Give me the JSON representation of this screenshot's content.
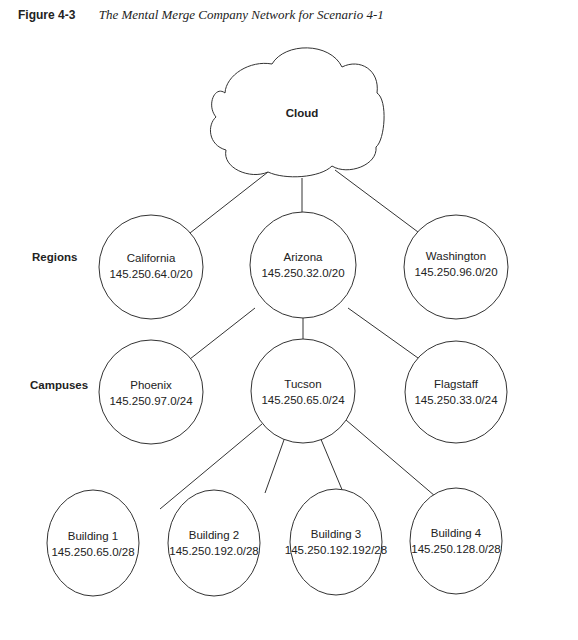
{
  "caption": {
    "figure_label": "Figure 4-3",
    "title": "The Mental Merge Company Network for Scenario 4-1"
  },
  "tiers": {
    "regions": "Regions",
    "campuses": "Campuses"
  },
  "cloud": {
    "label": "Cloud"
  },
  "regions": [
    {
      "name": "California",
      "subnet": "145.250.64.0/20"
    },
    {
      "name": "Arizona",
      "subnet": "145.250.32.0/20"
    },
    {
      "name": "Washington",
      "subnet": "145.250.96.0/20"
    }
  ],
  "campuses": [
    {
      "name": "Phoenix",
      "subnet": "145.250.97.0/24"
    },
    {
      "name": "Tucson",
      "subnet": "145.250.65.0/24"
    },
    {
      "name": "Flagstaff",
      "subnet": "145.250.33.0/24"
    }
  ],
  "buildings": [
    {
      "name": "Building 1",
      "subnet": "145.250.65.0/28"
    },
    {
      "name": "Building 2",
      "subnet": "145.250.192.0/28"
    },
    {
      "name": "Building 3",
      "subnet": "145.250.192.192/28"
    },
    {
      "name": "Building 4",
      "subnet": "145.250.128.0/28"
    }
  ]
}
